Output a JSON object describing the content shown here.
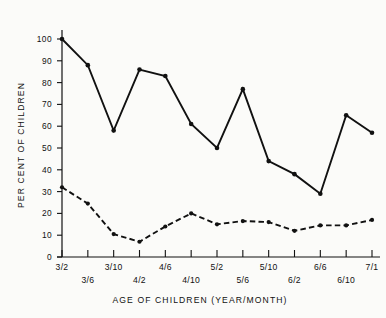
{
  "chart_data": {
    "type": "line",
    "title": "",
    "xlabel": "AGE OF CHILDREN (YEAR/MONTH)",
    "ylabel": "PER CENT OF CHILDREN",
    "categories": [
      "3/2",
      "3/6",
      "3/10",
      "4/2",
      "4/6",
      "4/10",
      "5/2",
      "5/6",
      "5/10",
      "6/2",
      "6/6",
      "6/10",
      "7/1"
    ],
    "ylim": [
      0,
      105
    ],
    "yticks": [
      0,
      10,
      20,
      30,
      40,
      50,
      60,
      70,
      80,
      90,
      100
    ],
    "ytick_labels": [
      "0",
      "10",
      "20",
      "30",
      "40",
      "50",
      "60",
      "70",
      "80",
      "90",
      "100"
    ],
    "grid": false,
    "legend": "none",
    "series": [
      {
        "name": "solid-line-series",
        "style": "solid",
        "marker": "filled-circle",
        "values": [
          100,
          88,
          58,
          86,
          83,
          61,
          50,
          77,
          44,
          38,
          29,
          65,
          57
        ]
      },
      {
        "name": "dashed-line-series",
        "style": "dashed",
        "marker": "filled-circle",
        "values": [
          32,
          24.5,
          10.5,
          7,
          14,
          20,
          15,
          16.5,
          16,
          12,
          14.5,
          14.5,
          17
        ]
      }
    ]
  },
  "axes": {
    "y_axis_title": "PER CENT OF CHILDREN",
    "x_axis_title": "AGE OF CHILDREN (YEAR/MONTH)"
  }
}
